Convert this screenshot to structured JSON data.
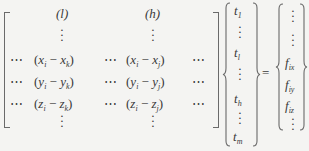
{
  "equation": {
    "matrix": {
      "col_headers": [
        "(l)",
        "(h)"
      ],
      "rows": [
        {
          "left": "⋯",
          "c1_var": "x",
          "c1_k": "k",
          "mid": "⋯",
          "c2_var": "x",
          "c2_j": "j",
          "right": "⋯"
        },
        {
          "left": "⋯",
          "c1_var": "y",
          "c1_k": "k",
          "mid": "⋯",
          "c2_var": "y",
          "c2_j": "j",
          "right": "⋯"
        },
        {
          "left": "⋯",
          "c1_var": "z",
          "c1_k": "k",
          "mid": "⋯",
          "c2_var": "z",
          "c2_j": "j",
          "right": "⋯"
        }
      ],
      "index_i": "i"
    },
    "vector_t": {
      "symbol": "t",
      "subs": [
        "1",
        "l",
        "h",
        "m"
      ]
    },
    "equals": "=",
    "rhs": {
      "symbol": "f",
      "subs": [
        "ix",
        "iy",
        "iz"
      ]
    }
  }
}
